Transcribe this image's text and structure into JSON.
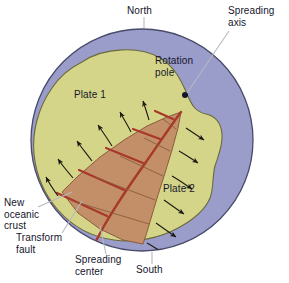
{
  "figure": {
    "type": "geology-diagram"
  },
  "labels": {
    "north": "North",
    "south": "South",
    "spreading_axis": "Spreading\naxis",
    "rotation_pole": "Rotation\npole",
    "plate1": "Plate 1",
    "plate2": "Plate 2",
    "new_oceanic_crust": "New\noceanic\ncrust",
    "transform_fault": "Transform\nfault",
    "spreading_center": "Spreading\ncenter"
  },
  "colors": {
    "ocean": "#9a9cca",
    "ocean_stroke": "#4a4a6a",
    "plate": "#d5d58a",
    "plate_stroke": "#6a6a3a",
    "crust": "#c28f69",
    "crust_stroke": "#8a5c3c",
    "fault": "#a8392a",
    "arrow": "#1a1a10",
    "leader": "#b8b8c0",
    "text": "#15152b",
    "background": "#ffffff"
  },
  "geometry": {
    "globe_center_x": 142,
    "globe_center_y": 140,
    "globe_radius": 112,
    "rotation_pole_x": 185,
    "rotation_pole_y": 95,
    "rotation_pole_dot_radius": 3
  },
  "elements": {
    "rotation_pole_marker": "rotation-pole-dot",
    "arrow_count_plate1": 6,
    "arrow_count_plate2": 6,
    "crust_segment_count": 5
  }
}
